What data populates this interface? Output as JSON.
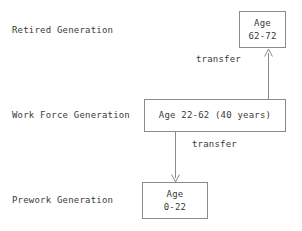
{
  "diagram": {
    "colors": {
      "text": "#3a3a3a",
      "box_border": "#8a8a8a",
      "arrow": "#8a8a8a",
      "background": "#ffffff"
    },
    "rows": [
      {
        "label": "Retired Generation"
      },
      {
        "label": "Work Force Generation"
      },
      {
        "label": "Prework Generation"
      }
    ],
    "nodes": {
      "retired": {
        "line1": "Age",
        "line2": "62-72"
      },
      "workforce": {
        "line1": "Age 22-62 (40 years)"
      },
      "prework": {
        "line1": "Age",
        "line2": "0-22"
      }
    },
    "edges": [
      {
        "label": "transfer",
        "direction": "up",
        "from": "workforce",
        "to": "retired"
      },
      {
        "label": "transfer",
        "direction": "down",
        "from": "workforce",
        "to": "prework"
      }
    ]
  }
}
